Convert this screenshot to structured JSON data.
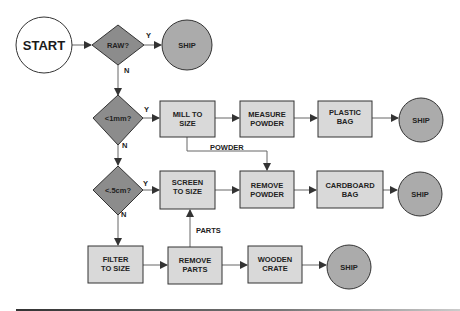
{
  "colors": {
    "diamond_fill": "#8c8c8c",
    "process_fill": "#d9d9d9",
    "ship_fill": "#ababab",
    "start_fill": "#ffffff",
    "stroke": "#333333",
    "line": "#666666",
    "footer_rule": "#444444"
  },
  "nodes": {
    "start": {
      "label": "START"
    },
    "raw": {
      "label": "RAW?"
    },
    "ship1": {
      "label": "SHIP"
    },
    "lt1mm": {
      "label": "<1mm?"
    },
    "mill": {
      "line1": "MILL TO",
      "line2": "SIZE"
    },
    "measure": {
      "line1": "MEASURE",
      "line2": "POWDER"
    },
    "plastic": {
      "line1": "PLASTIC",
      "line2": "BAG"
    },
    "ship2": {
      "label": "SHIP"
    },
    "lt5cm": {
      "label": "<.5cm?"
    },
    "screen": {
      "line1": "SCREEN",
      "line2": "TO SIZE"
    },
    "removepowder": {
      "line1": "REMOVE",
      "line2": "POWDER"
    },
    "cardboard": {
      "line1": "CARDBOARD",
      "line2": "BAG"
    },
    "ship3": {
      "label": "SHIP"
    },
    "filter": {
      "line1": "FILTER",
      "line2": "TO SIZE"
    },
    "removeparts": {
      "line1": "REMOVE",
      "line2": "PARTS"
    },
    "wooden": {
      "line1": "WOODEN",
      "line2": "CRATE"
    },
    "ship4": {
      "label": "SHIP"
    }
  },
  "edges": {
    "raw_yes": "Y",
    "raw_no": "N",
    "lt1mm_yes": "Y",
    "lt1mm_no": "N",
    "lt5cm_yes": "Y",
    "lt5cm_no": "N",
    "powder": "POWDER",
    "parts": "PARTS"
  }
}
